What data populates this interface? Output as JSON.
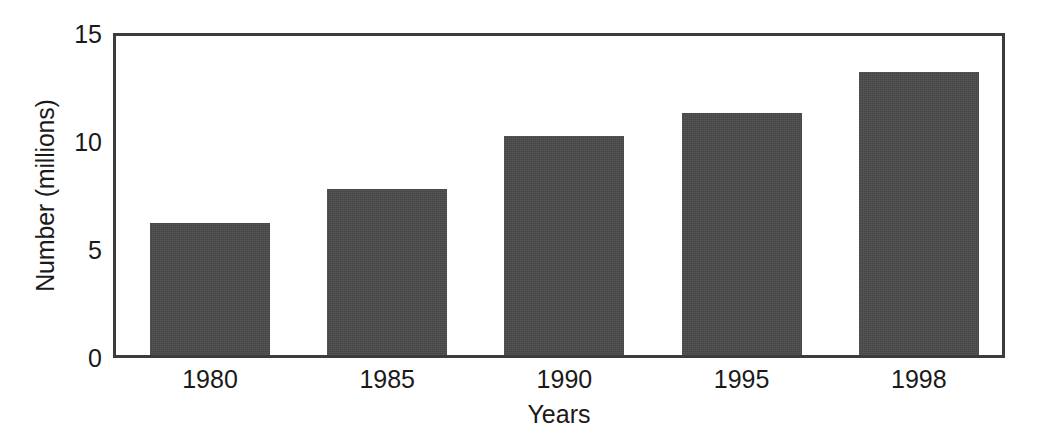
{
  "chart_data": {
    "type": "bar",
    "title": "",
    "subtitle": "",
    "categories": [
      "1980",
      "1985",
      "1990",
      "1995",
      "1998"
    ],
    "values": [
      6.2,
      7.8,
      10.3,
      11.4,
      13.3
    ],
    "xlabel": "Years",
    "ylabel": "Number (millions)",
    "ylim": [
      0,
      15
    ],
    "yticks": [
      0,
      5,
      10,
      15
    ],
    "ytick_labels": [
      "0",
      "5",
      "10",
      "15"
    ],
    "grid": false,
    "legend": null,
    "legend_position": "none",
    "bar_color": "#4a4a4a",
    "frame_color": "#3c3c3c",
    "background_color": "#ffffff",
    "text_color": "#1a1a1a",
    "annotations": []
  }
}
